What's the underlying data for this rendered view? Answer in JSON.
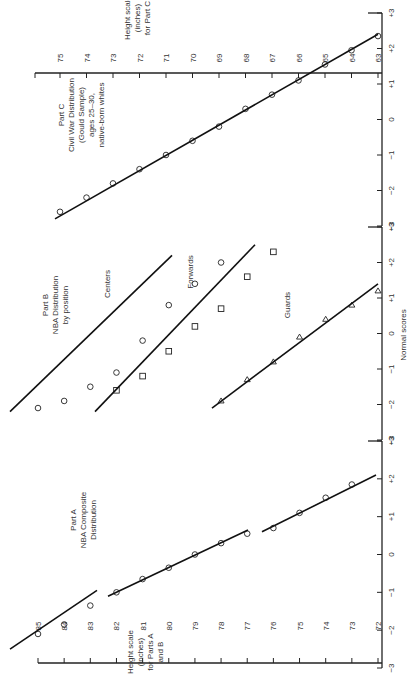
{
  "chart_data": {
    "type": "scatter",
    "orientation": "rotated 90deg counter-clockwise (normal scores run top-to-bottom at right edge)",
    "xlabel": "Normal scores",
    "x_ticks": [
      "-3",
      "-2",
      "-1",
      "0",
      "+1",
      "+2",
      "+3"
    ],
    "panels": [
      {
        "id": "A",
        "label_lines": [
          "Part A",
          "NBA Composite",
          "Distribution"
        ],
        "height_axis_label_lines": [
          "Height scale",
          "(inches)",
          "for Parts A",
          "and B"
        ],
        "height_ticks": [
          85,
          84,
          83,
          82,
          81,
          80,
          79,
          78,
          77,
          76,
          75,
          74,
          73,
          72
        ],
        "series": [
          {
            "name": "Composite (tall segment)",
            "marker": "circle",
            "points": [
              [
                -2.1,
                85
              ],
              [
                -1.85,
                84
              ],
              [
                -1.35,
                83
              ],
              [
                -1.0,
                82
              ],
              [
                -0.65,
                81
              ],
              [
                -0.35,
                80
              ],
              [
                0.0,
                79
              ],
              [
                0.3,
                78
              ],
              [
                0.55,
                77
              ]
            ]
          },
          {
            "name": "Composite (short segment)",
            "marker": "circle",
            "points": [
              [
                0.7,
                76
              ],
              [
                1.1,
                75
              ],
              [
                1.5,
                74
              ],
              [
                1.85,
                73
              ]
            ]
          }
        ]
      },
      {
        "id": "B",
        "label_lines": [
          "Part B",
          "NBA Distribution",
          "by position"
        ],
        "series": [
          {
            "name": "Centers",
            "marker": "circle",
            "points": [
              [
                -2.1,
                85
              ],
              [
                -1.9,
                84
              ],
              [
                -1.5,
                83
              ],
              [
                -1.1,
                82
              ],
              [
                -0.2,
                81
              ],
              [
                0.8,
                80
              ],
              [
                1.4,
                79
              ],
              [
                2.0,
                78
              ]
            ]
          },
          {
            "name": "Forwards",
            "marker": "square",
            "points": [
              [
                -1.6,
                82
              ],
              [
                -1.2,
                81
              ],
              [
                -0.5,
                80
              ],
              [
                0.2,
                79
              ],
              [
                0.7,
                78
              ],
              [
                1.6,
                77
              ],
              [
                2.3,
                76
              ]
            ]
          },
          {
            "name": "Guards",
            "marker": "triangle",
            "points": [
              [
                -1.9,
                78
              ],
              [
                -1.3,
                77
              ],
              [
                -0.8,
                76
              ],
              [
                -0.1,
                75
              ],
              [
                0.4,
                74
              ],
              [
                0.8,
                73
              ],
              [
                1.2,
                72
              ]
            ]
          }
        ]
      },
      {
        "id": "C",
        "label_lines": [
          "Part C",
          "Civil War Distribution",
          "(Gould Sample)",
          "ages 25-30,",
          "native-born whites"
        ],
        "height_axis_label_lines": [
          "Height scale",
          "(inches)",
          "for Part C"
        ],
        "height_ticks": [
          75,
          74,
          73,
          72,
          71,
          70,
          69,
          68,
          67,
          66,
          65,
          64,
          63
        ],
        "series": [
          {
            "name": "Civil War heights",
            "marker": "circle",
            "points": [
              [
                -2.6,
                75
              ],
              [
                -2.2,
                74
              ],
              [
                -1.8,
                73
              ],
              [
                -1.4,
                72
              ],
              [
                -1.0,
                71
              ],
              [
                -0.6,
                70
              ],
              [
                -0.2,
                69
              ],
              [
                0.3,
                68
              ],
              [
                0.7,
                67
              ],
              [
                1.1,
                66
              ],
              [
                1.55,
                65
              ],
              [
                1.95,
                64
              ],
              [
                2.35,
                63
              ]
            ]
          }
        ]
      }
    ],
    "grid": false,
    "legend": "none (series labelled inline)"
  },
  "labels": {
    "normal_scores": "Normal scores",
    "height_ab": [
      "Height scale",
      "(inches)",
      "for Parts A",
      "and B"
    ],
    "height_c": [
      "Height scale",
      "(inches)",
      "for Part C"
    ],
    "part_a": [
      "Part A",
      "NBA Composite",
      "Distribution"
    ],
    "part_b": [
      "Part B",
      "NBA Distribution",
      "by position"
    ],
    "part_c": [
      "Part C",
      "Civil War Distribution",
      "(Gould Sample)",
      "ages 25–30,",
      "native-born whites"
    ],
    "centers": "Centers",
    "forwards": "Forwards",
    "guards": "Guards"
  }
}
